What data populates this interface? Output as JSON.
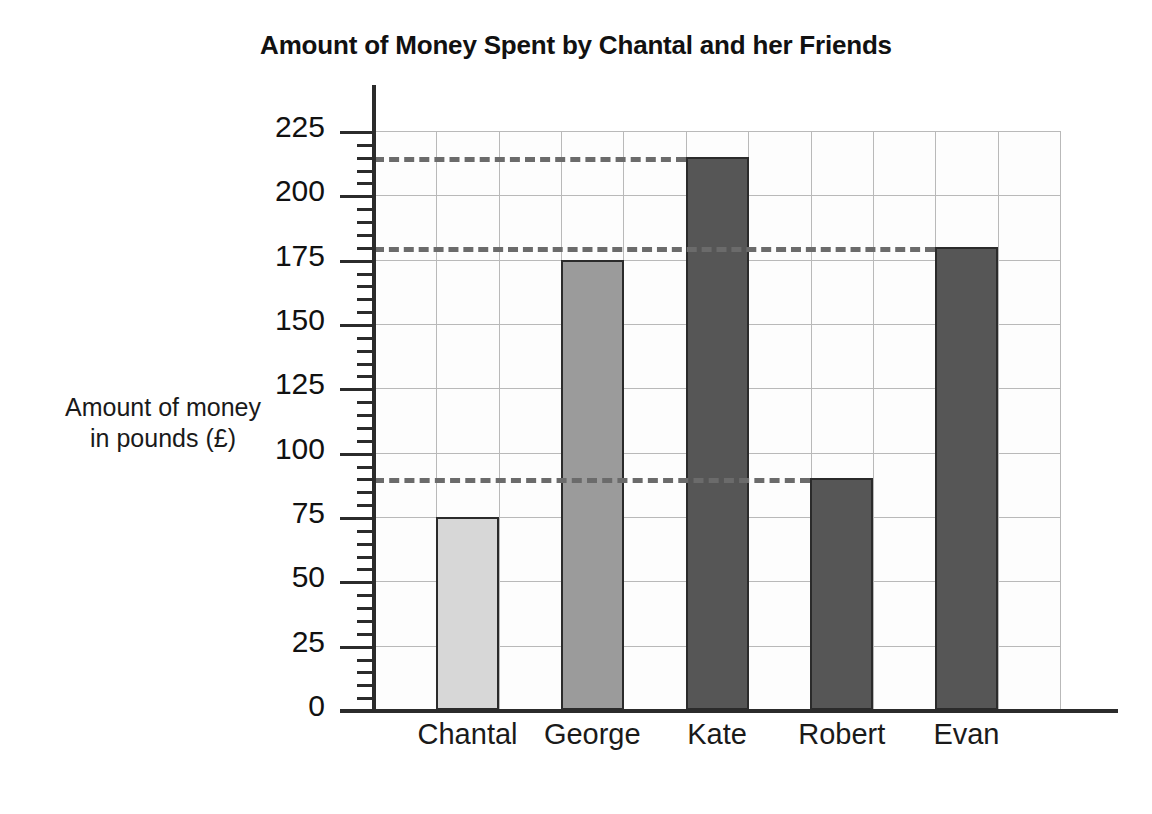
{
  "chart_data": {
    "type": "bar",
    "title": "Amount of Money Spent by Chantal and her Friends",
    "xlabel": "",
    "ylabel": "Amount of money in pounds (£)",
    "ylabel_lines": [
      "Amount of money",
      "in pounds (£)"
    ],
    "categories": [
      "Chantal",
      "George",
      "Kate",
      "Robert",
      "Evan"
    ],
    "values": [
      75,
      175,
      215,
      90,
      180
    ],
    "bar_colors": [
      "#d7d7d7",
      "#9b9b9b",
      "#565656",
      "#565656",
      "#565656"
    ],
    "ylim": [
      0,
      225
    ],
    "ytick_step": 25,
    "yticks": [
      0,
      25,
      50,
      75,
      100,
      125,
      150,
      175,
      200,
      225
    ],
    "ytick_labels": [
      "0",
      "25",
      "50",
      "75",
      "100",
      "125",
      "150",
      "175",
      "200",
      "225"
    ],
    "minor_tick_step": 5,
    "grid": true,
    "grid_color": "#b9b9b9",
    "legend": null,
    "reference_lines": [
      {
        "value": 215,
        "style": "dashed",
        "extends_to_category": "Kate",
        "color": "#6b6b6b"
      },
      {
        "value": 180,
        "style": "dashed",
        "extends_to_category": "Evan",
        "color": "#6b6b6b"
      },
      {
        "value": 90,
        "style": "dashed",
        "extends_to_category": "Robert",
        "color": "#6b6b6b"
      }
    ],
    "axis_color": "#2b2b2b",
    "background": "#ffffff"
  }
}
